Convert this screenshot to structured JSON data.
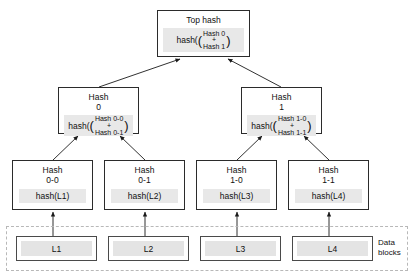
{
  "diagram": {
    "type": "merkle-tree",
    "nodes": {
      "top": {
        "title": "Top hash",
        "hash_word": "hash(",
        "operand_a": "Hash 0",
        "operator": "+",
        "operand_b": "Hash 1",
        "close_paren": ")"
      },
      "hash0": {
        "title": "Hash\n0",
        "hash_word": "hash(",
        "operand_a": "Hash 0-0",
        "operator": "+",
        "operand_b": "Hash 0-1",
        "close_paren": ")"
      },
      "hash1": {
        "title": "Hash\n1",
        "hash_word": "hash(",
        "operand_a": "Hash 1-0",
        "operator": "+",
        "operand_b": "Hash 1-1",
        "close_paren": ")"
      },
      "hash00": {
        "title": "Hash\n0-0",
        "expression": "hash(L1)"
      },
      "hash01": {
        "title": "Hash\n0-1",
        "expression": "hash(L2)"
      },
      "hash10": {
        "title": "Hash\n1-0",
        "expression": "hash(L3)"
      },
      "hash11": {
        "title": "Hash\n1-1",
        "expression": "hash(L4)"
      }
    },
    "data_blocks": {
      "label": "Data\nblocks",
      "items": [
        {
          "label": "L1"
        },
        {
          "label": "L2"
        },
        {
          "label": "L3"
        },
        {
          "label": "L4"
        }
      ]
    },
    "colors": {
      "node_border": "#2b2b2b",
      "panel_fill": "#e8e8e8",
      "block_fill": "#e4e4e4",
      "dashed_border": "#b8b8b8",
      "arrow": "#1a1a1a",
      "background": "#ffffff"
    }
  }
}
